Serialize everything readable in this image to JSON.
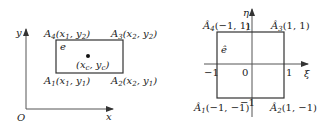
{
  "left_diagram": {
    "title": "Physical element e in x-y coordinates",
    "axes": {
      "x_label": "x",
      "y_label": "y",
      "origin_label": "O"
    },
    "element_label": "e",
    "center_label": "(x_c, y_c)",
    "center": {
      "base_open": "(x",
      "sub1": "c",
      "mid": ", y",
      "sub2": "c",
      "close": ")"
    },
    "nodes": [
      {
        "id": "A1",
        "name": "A",
        "index": "1",
        "coords_open": "(x",
        "cx": "1",
        "mid": ", y",
        "cy": "1",
        "close": ")"
      },
      {
        "id": "A2",
        "name": "A",
        "index": "2",
        "coords_open": "(x",
        "cx": "2",
        "mid": ", y",
        "cy": "1",
        "close": ")"
      },
      {
        "id": "A3",
        "name": "A",
        "index": "3",
        "coords_open": "(x",
        "cx": "2",
        "mid": ", y",
        "cy": "2",
        "close": ")"
      },
      {
        "id": "A4",
        "name": "A",
        "index": "4",
        "coords_open": "(x",
        "cx": "1",
        "mid": ", y",
        "cy": "2",
        "close": ")"
      }
    ]
  },
  "right_diagram": {
    "title": "Reference element ê in ξ-η coordinates",
    "axes": {
      "xi_label": "ξ",
      "eta_label": "η",
      "origin_label": "0"
    },
    "element_label": "ê",
    "ticks": {
      "x_neg": "−1",
      "x_pos": "1",
      "y_pos": "1",
      "y_neg": "−1"
    },
    "nodes": [
      {
        "id": "Â1",
        "name": "Â",
        "index": "1",
        "coords": "(−1, −1)"
      },
      {
        "id": "Â2",
        "name": "Â",
        "index": "2",
        "coords": "(1, −1)"
      },
      {
        "id": "Â3",
        "name": "Â",
        "index": "3",
        "coords": "(1, 1)"
      },
      {
        "id": "Â4",
        "name": "Â",
        "index": "4",
        "coords": "(−1, 1)"
      }
    ]
  }
}
